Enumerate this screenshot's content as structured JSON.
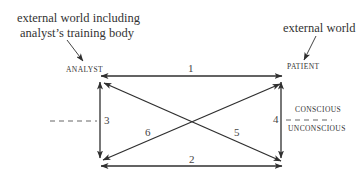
{
  "diagram": {
    "notes": {
      "left": "external world including\nanalyst’s training body",
      "left_line1": "external world including",
      "left_line2": "analyst’s training body",
      "right": "external world"
    },
    "nodes": {
      "analyst": "ANALYST",
      "patient": "PATIENT"
    },
    "levels": {
      "conscious": "CONSCIOUS",
      "unconscious": "UNCONSCIOUS"
    },
    "edges": [
      {
        "id": "1",
        "from": "analyst-conscious",
        "to": "patient-conscious",
        "direction": "bidirectional"
      },
      {
        "id": "2",
        "from": "analyst-unconscious",
        "to": "patient-unconscious",
        "direction": "bidirectional"
      },
      {
        "id": "3",
        "from": "analyst-conscious",
        "to": "analyst-unconscious",
        "direction": "bidirectional"
      },
      {
        "id": "4",
        "from": "patient-conscious",
        "to": "patient-unconscious",
        "direction": "bidirectional"
      },
      {
        "id": "5",
        "from": "analyst-conscious",
        "to": "patient-unconscious",
        "direction": "bidirectional"
      },
      {
        "id": "6",
        "from": "analyst-unconscious",
        "to": "patient-conscious",
        "direction": "bidirectional"
      }
    ],
    "edge_labels": {
      "e1": "1",
      "e2": "2",
      "e3": "3",
      "e4": "4",
      "e5": "5",
      "e6": "6"
    },
    "colors": {
      "line": "#2f2f2f",
      "text": "#333333"
    }
  }
}
